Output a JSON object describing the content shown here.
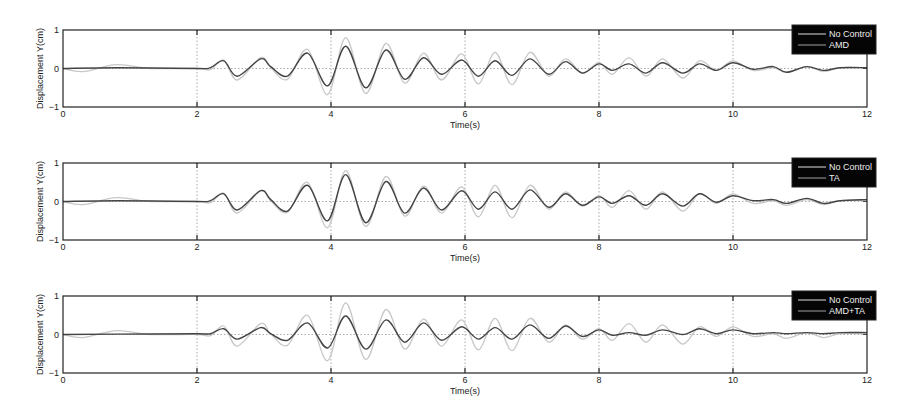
{
  "chart_data": [
    {
      "type": "line",
      "title": "",
      "xlabel": "Time(s)",
      "ylabel": "Displacement Y(cm)",
      "xlim": [
        0,
        12
      ],
      "ylim": [
        -1,
        1
      ],
      "xticks": [
        0,
        2,
        4,
        6,
        8,
        10,
        12
      ],
      "yticks": [
        -1,
        0,
        1
      ],
      "grid": "dotted vertical lines at x ticks, dotted horizontal at y=0",
      "legend": {
        "position": "upper right",
        "entries": [
          "No Control",
          "AMD"
        ]
      },
      "series": [
        {
          "name": "No Control",
          "color": "#c8c8c8",
          "points": [
            [
              0,
              0
            ],
            [
              0.3,
              -0.08
            ],
            [
              0.8,
              0.1
            ],
            [
              1.3,
              0
            ],
            [
              2,
              0
            ],
            [
              2.2,
              -0.03
            ],
            [
              2.4,
              0.22
            ],
            [
              2.6,
              -0.3
            ],
            [
              2.95,
              0.28
            ],
            [
              3.1,
              0.02
            ],
            [
              3.35,
              -0.28
            ],
            [
              3.65,
              0.5
            ],
            [
              3.95,
              -0.68
            ],
            [
              4.22,
              0.8
            ],
            [
              4.52,
              -0.65
            ],
            [
              4.82,
              0.65
            ],
            [
              5.1,
              -0.38
            ],
            [
              5.38,
              0.4
            ],
            [
              5.65,
              -0.3
            ],
            [
              5.95,
              0.38
            ],
            [
              6.2,
              -0.4
            ],
            [
              6.45,
              0.42
            ],
            [
              6.7,
              -0.42
            ],
            [
              6.97,
              0.42
            ],
            [
              7.25,
              -0.2
            ],
            [
              7.5,
              0.25
            ],
            [
              7.75,
              -0.12
            ],
            [
              8.0,
              0.15
            ],
            [
              8.2,
              -0.15
            ],
            [
              8.45,
              0.28
            ],
            [
              8.7,
              -0.2
            ],
            [
              8.95,
              0.25
            ],
            [
              9.25,
              -0.25
            ],
            [
              9.5,
              0.2
            ],
            [
              9.75,
              -0.05
            ],
            [
              10.0,
              0.2
            ],
            [
              10.3,
              -0.05
            ],
            [
              10.6,
              0.02
            ],
            [
              10.8,
              -0.1
            ],
            [
              11.1,
              0.05
            ],
            [
              11.35,
              -0.08
            ],
            [
              11.6,
              0.02
            ],
            [
              12,
              0.02
            ]
          ]
        },
        {
          "name": "AMD",
          "color": "#444444",
          "points": [
            [
              0,
              0
            ],
            [
              0.8,
              0.02
            ],
            [
              2,
              0
            ],
            [
              2.2,
              0.02
            ],
            [
              2.4,
              0.2
            ],
            [
              2.6,
              -0.2
            ],
            [
              2.95,
              0.25
            ],
            [
              3.1,
              0.05
            ],
            [
              3.35,
              -0.2
            ],
            [
              3.65,
              0.4
            ],
            [
              3.95,
              -0.45
            ],
            [
              4.22,
              0.58
            ],
            [
              4.52,
              -0.5
            ],
            [
              4.82,
              0.48
            ],
            [
              5.1,
              -0.28
            ],
            [
              5.38,
              0.28
            ],
            [
              5.65,
              -0.15
            ],
            [
              5.95,
              0.22
            ],
            [
              6.2,
              -0.2
            ],
            [
              6.45,
              0.2
            ],
            [
              6.7,
              -0.18
            ],
            [
              6.97,
              0.25
            ],
            [
              7.25,
              -0.15
            ],
            [
              7.5,
              0.18
            ],
            [
              7.75,
              -0.12
            ],
            [
              8.0,
              0.12
            ],
            [
              8.2,
              -0.05
            ],
            [
              8.45,
              0.12
            ],
            [
              8.7,
              -0.12
            ],
            [
              8.95,
              0.15
            ],
            [
              9.25,
              -0.12
            ],
            [
              9.5,
              0.12
            ],
            [
              9.75,
              -0.05
            ],
            [
              10.0,
              0.15
            ],
            [
              10.3,
              -0.02
            ],
            [
              10.6,
              0.05
            ],
            [
              10.8,
              -0.1
            ],
            [
              11.1,
              0.05
            ],
            [
              11.35,
              -0.05
            ],
            [
              11.6,
              0.02
            ],
            [
              12,
              0.02
            ]
          ]
        }
      ]
    },
    {
      "type": "line",
      "title": "",
      "xlabel": "Time(s)",
      "ylabel": "Displacement Y(cm)",
      "xlim": [
        0,
        12
      ],
      "ylim": [
        -1,
        1
      ],
      "xticks": [
        0,
        2,
        4,
        6,
        8,
        10,
        12
      ],
      "yticks": [
        -1,
        0,
        1
      ],
      "grid": "dotted vertical lines at x ticks, dotted horizontal at y=0",
      "legend": {
        "position": "upper right",
        "entries": [
          "No Control",
          "TA"
        ]
      },
      "series": [
        {
          "name": "No Control",
          "color": "#c8c8c8",
          "points": [
            [
              0,
              0
            ],
            [
              0.3,
              -0.08
            ],
            [
              0.8,
              0.1
            ],
            [
              1.3,
              0
            ],
            [
              2,
              0
            ],
            [
              2.2,
              -0.03
            ],
            [
              2.4,
              0.22
            ],
            [
              2.6,
              -0.3
            ],
            [
              2.95,
              0.28
            ],
            [
              3.1,
              0.02
            ],
            [
              3.35,
              -0.28
            ],
            [
              3.65,
              0.5
            ],
            [
              3.95,
              -0.68
            ],
            [
              4.22,
              0.8
            ],
            [
              4.52,
              -0.65
            ],
            [
              4.82,
              0.65
            ],
            [
              5.1,
              -0.38
            ],
            [
              5.38,
              0.4
            ],
            [
              5.65,
              -0.3
            ],
            [
              5.95,
              0.38
            ],
            [
              6.2,
              -0.4
            ],
            [
              6.45,
              0.42
            ],
            [
              6.7,
              -0.42
            ],
            [
              6.97,
              0.42
            ],
            [
              7.25,
              -0.2
            ],
            [
              7.5,
              0.25
            ],
            [
              7.75,
              -0.12
            ],
            [
              8.0,
              0.15
            ],
            [
              8.2,
              -0.15
            ],
            [
              8.45,
              0.28
            ],
            [
              8.7,
              -0.2
            ],
            [
              8.95,
              0.25
            ],
            [
              9.25,
              -0.25
            ],
            [
              9.5,
              0.2
            ],
            [
              9.75,
              -0.05
            ],
            [
              10.0,
              0.2
            ],
            [
              10.3,
              -0.05
            ],
            [
              10.6,
              0.02
            ],
            [
              10.8,
              -0.1
            ],
            [
              11.1,
              0.05
            ],
            [
              11.35,
              -0.08
            ],
            [
              11.6,
              0.02
            ],
            [
              12,
              0.02
            ]
          ]
        },
        {
          "name": "TA",
          "color": "#444444",
          "points": [
            [
              0,
              0
            ],
            [
              0.8,
              0.02
            ],
            [
              2,
              0
            ],
            [
              2.2,
              0.02
            ],
            [
              2.4,
              0.2
            ],
            [
              2.6,
              -0.22
            ],
            [
              2.95,
              0.28
            ],
            [
              3.1,
              0.05
            ],
            [
              3.35,
              -0.25
            ],
            [
              3.65,
              0.42
            ],
            [
              3.95,
              -0.5
            ],
            [
              4.22,
              0.7
            ],
            [
              4.52,
              -0.55
            ],
            [
              4.82,
              0.52
            ],
            [
              5.1,
              -0.3
            ],
            [
              5.38,
              0.35
            ],
            [
              5.65,
              -0.22
            ],
            [
              5.95,
              0.28
            ],
            [
              6.2,
              -0.2
            ],
            [
              6.45,
              0.25
            ],
            [
              6.7,
              -0.2
            ],
            [
              6.97,
              0.3
            ],
            [
              7.25,
              -0.15
            ],
            [
              7.5,
              0.2
            ],
            [
              7.75,
              -0.1
            ],
            [
              8.0,
              0.12
            ],
            [
              8.2,
              -0.05
            ],
            [
              8.45,
              0.15
            ],
            [
              8.7,
              -0.1
            ],
            [
              8.95,
              0.2
            ],
            [
              9.25,
              -0.12
            ],
            [
              9.5,
              0.2
            ],
            [
              9.75,
              -0.02
            ],
            [
              10.0,
              0.15
            ],
            [
              10.3,
              0.02
            ],
            [
              10.6,
              0.05
            ],
            [
              10.8,
              -0.05
            ],
            [
              11.1,
              0.08
            ],
            [
              11.35,
              -0.05
            ],
            [
              11.6,
              0.02
            ],
            [
              12,
              0.05
            ]
          ]
        }
      ]
    },
    {
      "type": "line",
      "title": "",
      "xlabel": "Time(s)",
      "ylabel": "Displacement Y(cm)",
      "xlim": [
        0,
        12
      ],
      "ylim": [
        -1,
        1
      ],
      "xticks": [
        0,
        2,
        4,
        6,
        8,
        10,
        12
      ],
      "yticks": [
        -1,
        0,
        1
      ],
      "grid": "dotted vertical lines at x ticks, dotted horizontal at y=0",
      "legend": {
        "position": "upper right",
        "entries": [
          "No Control",
          "AMD+TA"
        ]
      },
      "series": [
        {
          "name": "No Control",
          "color": "#c8c8c8",
          "points": [
            [
              0,
              0
            ],
            [
              0.3,
              -0.08
            ],
            [
              0.8,
              0.1
            ],
            [
              1.3,
              0
            ],
            [
              2,
              0
            ],
            [
              2.2,
              -0.03
            ],
            [
              2.4,
              0.22
            ],
            [
              2.6,
              -0.3
            ],
            [
              2.95,
              0.28
            ],
            [
              3.1,
              0.02
            ],
            [
              3.35,
              -0.28
            ],
            [
              3.65,
              0.5
            ],
            [
              3.95,
              -0.68
            ],
            [
              4.22,
              0.82
            ],
            [
              4.52,
              -0.65
            ],
            [
              4.82,
              0.65
            ],
            [
              5.1,
              -0.38
            ],
            [
              5.38,
              0.4
            ],
            [
              5.65,
              -0.3
            ],
            [
              5.95,
              0.38
            ],
            [
              6.2,
              -0.4
            ],
            [
              6.45,
              0.42
            ],
            [
              6.7,
              -0.42
            ],
            [
              6.97,
              0.42
            ],
            [
              7.25,
              -0.2
            ],
            [
              7.5,
              0.25
            ],
            [
              7.75,
              -0.12
            ],
            [
              8.0,
              0.15
            ],
            [
              8.2,
              -0.15
            ],
            [
              8.45,
              0.28
            ],
            [
              8.7,
              -0.2
            ],
            [
              8.95,
              0.25
            ],
            [
              9.25,
              -0.25
            ],
            [
              9.5,
              0.2
            ],
            [
              9.75,
              -0.05
            ],
            [
              10.0,
              0.2
            ],
            [
              10.3,
              -0.05
            ],
            [
              10.6,
              0.02
            ],
            [
              10.8,
              -0.1
            ],
            [
              11.1,
              0.05
            ],
            [
              11.35,
              -0.08
            ],
            [
              11.6,
              0.02
            ],
            [
              12,
              0.02
            ]
          ]
        },
        {
          "name": "AMD+TA",
          "color": "#444444",
          "points": [
            [
              0,
              0
            ],
            [
              0.8,
              0.01
            ],
            [
              2,
              0.02
            ],
            [
              2.2,
              0.02
            ],
            [
              2.4,
              0.15
            ],
            [
              2.6,
              -0.12
            ],
            [
              2.95,
              0.18
            ],
            [
              3.1,
              0.02
            ],
            [
              3.35,
              -0.15
            ],
            [
              3.65,
              0.3
            ],
            [
              3.95,
              -0.35
            ],
            [
              4.22,
              0.48
            ],
            [
              4.52,
              -0.38
            ],
            [
              4.82,
              0.38
            ],
            [
              5.1,
              -0.2
            ],
            [
              5.38,
              0.3
            ],
            [
              5.65,
              -0.15
            ],
            [
              5.95,
              0.2
            ],
            [
              6.2,
              -0.12
            ],
            [
              6.45,
              0.18
            ],
            [
              6.7,
              -0.12
            ],
            [
              6.97,
              0.25
            ],
            [
              7.25,
              -0.1
            ],
            [
              7.5,
              0.22
            ],
            [
              7.75,
              -0.05
            ],
            [
              8.0,
              0.12
            ],
            [
              8.2,
              -0.02
            ],
            [
              8.45,
              0.05
            ],
            [
              8.7,
              -0.02
            ],
            [
              8.95,
              0.12
            ],
            [
              9.25,
              0.0
            ],
            [
              9.5,
              0.15
            ],
            [
              9.75,
              0.02
            ],
            [
              10.0,
              0.12
            ],
            [
              10.3,
              0.02
            ],
            [
              10.6,
              0.05
            ],
            [
              10.8,
              0.02
            ],
            [
              11.1,
              0.05
            ],
            [
              11.35,
              0.02
            ],
            [
              11.6,
              0.05
            ],
            [
              12,
              0.05
            ]
          ]
        }
      ]
    }
  ],
  "layout": {
    "panels": [
      {
        "top": 30,
        "bottom": 107
      },
      {
        "top": 163,
        "bottom": 240
      },
      {
        "top": 296,
        "bottom": 373
      }
    ],
    "x_left": 63,
    "x_right": 867
  }
}
